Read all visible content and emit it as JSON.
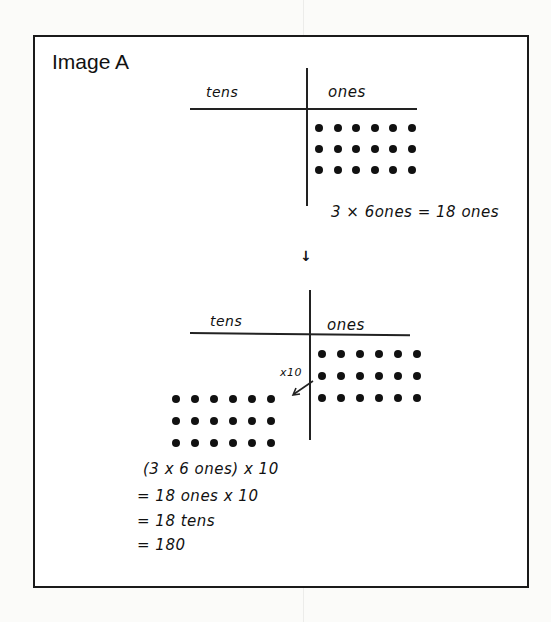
{
  "figure": {
    "title": "Image A"
  },
  "top_chart": {
    "left_header": "tens",
    "right_header": "ones",
    "ones_dots": {
      "rows": 3,
      "cols": 6
    },
    "equation": "3 × 6ones = 18 ones"
  },
  "transition_arrow": "↓",
  "bottom_chart": {
    "left_header": "tens",
    "right_header": "ones",
    "ones_dots": {
      "rows": 3,
      "cols": 6
    },
    "tens_dots": {
      "rows": 3,
      "cols": 6
    },
    "arrow_label": "x10"
  },
  "work": {
    "line1": "(3 x 6 ones) x 10",
    "line2": "= 18 ones x 10",
    "line3": "= 18 tens",
    "line4": "= 180"
  }
}
